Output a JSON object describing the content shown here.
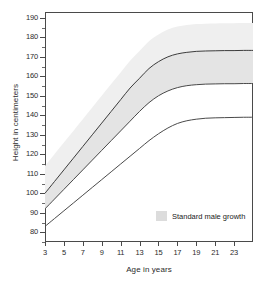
{
  "chart_data": {
    "type": "line",
    "title": "",
    "xlabel": "Age in years",
    "ylabel": "Height in centimeters",
    "xlim": [
      3,
      25
    ],
    "ylim": [
      75,
      193
    ],
    "grid": false,
    "legend_position": "inside-bottom-right",
    "x_tick_labels": [
      "3",
      "5",
      "7",
      "9",
      "11",
      "13",
      "15",
      "17",
      "19",
      "21",
      "23"
    ],
    "x_tick_values": [
      3,
      5,
      7,
      9,
      11,
      13,
      15,
      17,
      19,
      21,
      23
    ],
    "y_tick_labels": [
      "80",
      "90",
      "100",
      "110",
      "120",
      "130",
      "140",
      "150",
      "160",
      "170",
      "180",
      "190"
    ],
    "y_tick_values": [
      80,
      90,
      100,
      110,
      120,
      130,
      140,
      150,
      160,
      170,
      180,
      190
    ],
    "y_minor_tick_values": [
      75,
      85,
      95,
      105,
      115,
      125,
      135,
      145,
      155,
      165,
      175,
      185
    ],
    "x": [
      3,
      4,
      5,
      6,
      7,
      8,
      9,
      10,
      11,
      12,
      13,
      14,
      15,
      16,
      17,
      18,
      19,
      20,
      21,
      22,
      23,
      24,
      25
    ],
    "series": [
      {
        "name": "upper-growth-curve",
        "color": "#3c3c3c",
        "values": [
          100,
          106,
          112,
          118,
          124,
          130,
          136,
          142,
          148,
          154,
          159,
          164,
          167.5,
          170,
          171.5,
          172.3,
          172.8,
          173,
          173.1,
          173.2,
          173.2,
          173.3,
          173.3
        ]
      },
      {
        "name": "middle-growth-curve",
        "color": "#4a4a4a",
        "values": [
          92,
          97,
          102,
          107,
          112,
          117,
          122,
          127,
          132,
          137,
          142,
          146.5,
          150,
          152.5,
          154.2,
          155.2,
          155.7,
          156,
          156.1,
          156.2,
          156.2,
          156.3,
          156.3
        ]
      },
      {
        "name": "lower-growth-curve",
        "color": "#4a4a4a",
        "values": [
          83,
          87,
          91,
          95,
          99,
          103,
          107,
          111,
          115,
          119,
          123,
          127,
          130.5,
          133.5,
          135.8,
          137.2,
          138,
          138.5,
          138.7,
          138.8,
          138.9,
          139,
          139
        ]
      }
    ],
    "shaded_band": {
      "name": "Standard male growth",
      "color": "#e4e4e4",
      "upper_values": [
        100,
        106,
        112,
        118,
        124,
        130,
        136,
        142,
        148,
        154,
        159,
        164,
        167.5,
        170,
        171.5,
        172.3,
        172.8,
        173,
        173.1,
        173.2,
        173.2,
        173.3,
        173.3
      ],
      "lower_values": [
        92,
        97,
        102,
        107,
        112,
        117,
        122,
        127,
        132,
        137,
        142,
        146.5,
        150,
        152.5,
        154.2,
        155.2,
        155.7,
        156,
        156.1,
        156.2,
        156.2,
        156.3,
        156.3
      ],
      "halo_color": "#efefef",
      "halo_offset_cm": 14
    },
    "legend": [
      {
        "label": "Standard male growth",
        "swatch_color": "#dcdcdc"
      }
    ]
  },
  "axes": {
    "y_title": "Height in centimeters",
    "x_title": "Age in years"
  },
  "legend": {
    "label": "Standard male growth"
  }
}
